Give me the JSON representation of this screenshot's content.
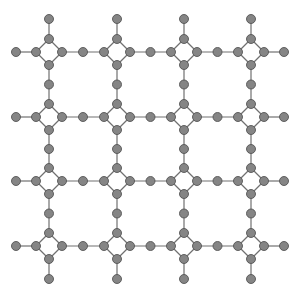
{
  "diagram": {
    "type": "lattice-graph",
    "grid": {
      "rows": 4,
      "cols": 4
    },
    "column_centers": [
      49,
      117,
      184,
      251
    ],
    "row_centers": [
      52,
      117,
      181,
      246
    ],
    "cluster_shape": "diamond",
    "diamond_radius": 13,
    "pendant_length": 20,
    "node_radius": 4.5,
    "colors": {
      "node_fill": "#858585",
      "node_stroke": "#555555",
      "edge": "#707070",
      "background": "#ffffff"
    }
  }
}
